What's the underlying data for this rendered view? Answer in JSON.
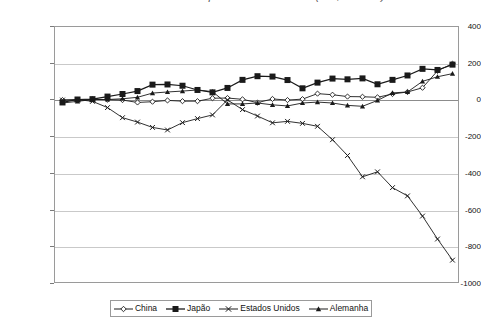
{
  "caption": {
    "text": "Gráfico 3 – Saldo em conta corrente de países selecionados (US$ bilhões)"
  },
  "chart_data": {
    "type": "line",
    "title": "",
    "xlabel": "",
    "ylabel": "",
    "ylim": [
      -1000,
      400
    ],
    "ytick_values": [
      400,
      200,
      0,
      -200,
      -400,
      -600,
      -800,
      -1000
    ],
    "ytick_labels": [
      "400",
      "200",
      "0",
      "-200",
      "-400",
      "-600",
      "-800",
      "-1000"
    ],
    "grid": true,
    "legend_position": "bottom",
    "x": [
      1980,
      1981,
      1982,
      1983,
      1984,
      1985,
      1986,
      1987,
      1988,
      1989,
      1990,
      1991,
      1992,
      1993,
      1994,
      1995,
      1996,
      1997,
      1998,
      1999,
      2000,
      2001,
      2002,
      2003,
      2004,
      2005,
      2006
    ],
    "xtick_labels": [
      "1980",
      "1985",
      "1990",
      "1995",
      "2000",
      "2005"
    ],
    "xtick_values": [
      1980,
      1985,
      1990,
      1995,
      2000,
      2005
    ],
    "series": [
      {
        "name": "China",
        "marker": "diamond",
        "values": [
          2,
          2,
          6,
          4,
          2,
          -11,
          -7,
          0,
          -4,
          -4,
          12,
          13,
          6,
          -12,
          8,
          2,
          7,
          37,
          31,
          21,
          20,
          17,
          35,
          46,
          69,
          161,
          200
        ]
      },
      {
        "name": "Japão",
        "marker": "square-filled",
        "values": [
          -11,
          5,
          7,
          21,
          35,
          51,
          86,
          87,
          80,
          57,
          44,
          68,
          112,
          132,
          130,
          111,
          66,
          97,
          119,
          115,
          120,
          88,
          112,
          136,
          172,
          166,
          195
        ]
      },
      {
        "name": "Estados Unidos",
        "marker": "cross",
        "values": [
          2,
          5,
          -5,
          -39,
          -94,
          -118,
          -147,
          -161,
          -121,
          -99,
          -79,
          3,
          -50,
          -85,
          -122,
          -114,
          -125,
          -141,
          -214,
          -300,
          -416,
          -389,
          -475,
          -520,
          -630,
          -755,
          -870
        ]
      },
      {
        "name": "Alemanha",
        "marker": "triangle-filled",
        "values": [
          -14,
          -5,
          5,
          5,
          9,
          17,
          40,
          46,
          51,
          57,
          48,
          -19,
          -19,
          -14,
          -24,
          -30,
          -14,
          -9,
          -14,
          -27,
          -32,
          0,
          41,
          46,
          104,
          129,
          146
        ]
      }
    ]
  },
  "legend": {
    "items": [
      {
        "label": "China",
        "marker": "diamond"
      },
      {
        "label": "Japão",
        "marker": "square-filled"
      },
      {
        "label": "Estados Unidos",
        "marker": "cross"
      },
      {
        "label": "Alemanha",
        "marker": "triangle-filled"
      }
    ]
  },
  "colors": {
    "line": "#1a1a1a",
    "grid": "#c9c9c9",
    "frame": "#9a9a9a",
    "background": "#ffffff"
  }
}
